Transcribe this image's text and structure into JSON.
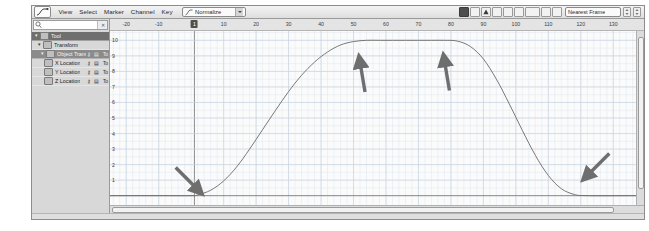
{
  "app": {
    "title": "Graph Editor",
    "accent_color": "#4e4e4e",
    "arrow_color": "#6e6e6e",
    "curve_color": "#6a6a6a",
    "grid_color": "#c9d6e2"
  },
  "menubar": {
    "editor_icon": "curve-editor-icon",
    "items": [
      {
        "label": "View"
      },
      {
        "label": "Select"
      },
      {
        "label": "Marker"
      },
      {
        "label": "Channel"
      },
      {
        "label": "Key"
      }
    ],
    "mode_select": {
      "icon": "fcurve-icon",
      "value": "Normalize",
      "chevron": "chevron-down-icon"
    }
  },
  "toolbar": {
    "buttons": [
      {
        "name": "stats-toggle-button",
        "glyph": "▣",
        "active": true
      },
      {
        "name": "key-filter-button",
        "glyph": "⣿",
        "active": false
      },
      {
        "name": "warning-button",
        "glyph": "▲",
        "active": false
      },
      {
        "name": "tangent-auto-button",
        "glyph": "◩",
        "active": false
      },
      {
        "name": "tangent-spline-button",
        "glyph": "◪",
        "active": false
      },
      {
        "name": "tangent-clamped-button",
        "glyph": "◧",
        "active": false
      },
      {
        "name": "tangent-linear-button",
        "glyph": "◨",
        "active": false
      },
      {
        "name": "tangent-flat-button",
        "glyph": "▬",
        "active": false
      },
      {
        "name": "tangent-step-button",
        "glyph": "◰",
        "active": false
      }
    ],
    "snap_select": {
      "value": "Nearest Frame",
      "chevron": "chevron-down-icon"
    },
    "spinners": [
      {
        "name": "snap-stepper-1"
      },
      {
        "name": "snap-stepper-2"
      }
    ]
  },
  "channel_panel": {
    "search": {
      "icon": "search-icon",
      "value": "",
      "placeholder": "",
      "clear_icon": "clear-icon"
    },
    "rows": [
      {
        "label": "Tool",
        "depth": 0,
        "selected": true,
        "expander": "▾",
        "has_swatch": true,
        "icons": [],
        "value": ""
      },
      {
        "label": "Transform",
        "depth": 1,
        "selected": false,
        "expander": "▾",
        "has_swatch": true,
        "icons": [],
        "value": ""
      },
      {
        "label": "Object Transform",
        "depth": 2,
        "selected": true,
        "expander": "▾",
        "has_swatch": true,
        "icons": [
          "key-icon",
          "lock-icon"
        ],
        "value": "To"
      },
      {
        "label": "X Location",
        "depth": 3,
        "selected": false,
        "expander": "",
        "has_swatch": true,
        "icons": [
          "key-icon",
          "lock-icon"
        ],
        "value": "To"
      },
      {
        "label": "Y Location",
        "depth": 3,
        "selected": false,
        "expander": "",
        "has_swatch": true,
        "icons": [
          "key-icon",
          "lock-icon"
        ],
        "value": "To"
      },
      {
        "label": "Z Location",
        "depth": 3,
        "selected": false,
        "expander": "",
        "has_swatch": true,
        "icons": [
          "key-icon",
          "lock-icon"
        ],
        "value": "To"
      }
    ]
  },
  "chart_data": {
    "type": "line",
    "title": "",
    "xlabel": "",
    "ylabel": "",
    "xlim": [
      -25,
      137
    ],
    "ylim": [
      -0.6,
      10.6
    ],
    "grid": true,
    "legend": "none",
    "x_ticks": [
      -20,
      -10,
      1,
      10,
      20,
      30,
      40,
      50,
      60,
      70,
      80,
      90,
      100,
      110,
      120,
      130
    ],
    "x_tick_labels": [
      "-20",
      "-10",
      "1",
      "10",
      "20",
      "30",
      "40",
      "50",
      "60",
      "70",
      "80",
      "90",
      "100",
      "110",
      "120",
      "130"
    ],
    "playhead_frame": 1,
    "y_ticks": [
      10,
      9,
      8,
      7,
      6,
      5,
      4,
      3,
      2,
      1
    ],
    "y_tick_labels": [
      "10",
      "9",
      "8",
      "7",
      "6",
      "5",
      "4",
      "3",
      "2",
      "1"
    ],
    "series": [
      {
        "name": "Location",
        "color": "#6a6a6a",
        "x": [
          -25,
          -10,
          0,
          2,
          6,
          10,
          14,
          18,
          22,
          26,
          30,
          34,
          38,
          42,
          46,
          50,
          54,
          58,
          62,
          66,
          70,
          74,
          78,
          82,
          86,
          90,
          94,
          98,
          102,
          106,
          110,
          114,
          118,
          122,
          137
        ],
        "y": [
          0,
          0,
          0,
          0.05,
          0.35,
          0.95,
          1.85,
          3.0,
          4.25,
          5.5,
          6.7,
          7.75,
          8.6,
          9.25,
          9.7,
          9.92,
          10,
          10,
          10,
          10,
          10,
          10,
          10,
          9.95,
          9.6,
          8.8,
          7.5,
          5.9,
          4.2,
          2.6,
          1.3,
          0.45,
          0.08,
          0,
          0
        ]
      }
    ],
    "annotations": [
      {
        "name": "arrow-annotation-1",
        "x": 2,
        "y": 0.4,
        "direction": "down-right",
        "target": "curve-start-flat"
      },
      {
        "name": "arrow-annotation-2",
        "x": 52,
        "y": 8.6,
        "direction": "up-left",
        "target": "plateau-left"
      },
      {
        "name": "arrow-annotation-3",
        "x": 78,
        "y": 8.7,
        "direction": "up-left",
        "target": "plateau-right"
      },
      {
        "name": "arrow-annotation-4",
        "x": 122,
        "y": 1.3,
        "direction": "down-left",
        "target": "curve-end-flat"
      }
    ]
  },
  "scrollbars": {
    "horizontal": {
      "name": "horizontal-scrollbar"
    },
    "vertical": {
      "name": "vertical-scrollbar"
    }
  }
}
